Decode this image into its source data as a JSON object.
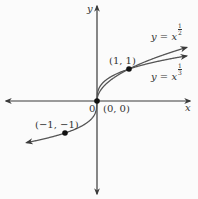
{
  "chart_data": {
    "type": "line",
    "title": "",
    "xlabel": "x",
    "ylabel": "y",
    "origin_label": "0",
    "xlim": [
      -3,
      3
    ],
    "ylim": [
      -3,
      3
    ],
    "grid": false,
    "series": [
      {
        "name": "y = x^(1/2)",
        "label_text": "y = x",
        "exponent_num": "1",
        "exponent_den": "2",
        "x": [
          0,
          0.25,
          0.5,
          1,
          1.5,
          2,
          2.75
        ],
        "y": [
          0,
          0.5,
          0.707,
          1,
          1.225,
          1.414,
          1.658
        ]
      },
      {
        "name": "y = x^(1/3)",
        "label_text": "y = x",
        "exponent_num": "1",
        "exponent_den": "3",
        "x": [
          -2.2,
          -1.5,
          -1,
          -0.5,
          -0.125,
          0,
          0.125,
          0.5,
          1,
          1.5,
          2,
          2.75
        ],
        "y": [
          -1.3,
          -1.145,
          -1,
          -0.794,
          -0.5,
          0,
          0.5,
          0.794,
          1,
          1.145,
          1.26,
          1.401
        ]
      }
    ],
    "points": [
      {
        "x": 0,
        "y": 0,
        "label": "(0, 0)"
      },
      {
        "x": 1,
        "y": 1,
        "label": "(1, 1)"
      },
      {
        "x": -1,
        "y": -1,
        "label": "(−1, −1)"
      }
    ]
  },
  "colors": {
    "axis": "#3a3a3a",
    "curve": "#555555",
    "point": "#111111",
    "text": "#333333"
  }
}
